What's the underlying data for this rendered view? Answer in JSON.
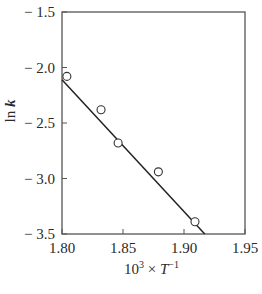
{
  "chart_data": {
    "type": "scatter",
    "title": "",
    "xlabel": "10^3 × T^-1",
    "xlabel_parts": {
      "base": "10",
      "exp": "3",
      "times": " × ",
      "var": "T",
      "var_exp": "−1"
    },
    "ylabel": "ln k",
    "xlim": [
      1.8,
      1.95
    ],
    "ylim": [
      -3.5,
      -1.5
    ],
    "xticks": [
      1.8,
      1.85,
      1.9,
      1.95
    ],
    "xtick_labels": [
      "1.80",
      "1.85",
      "1.90",
      "1.95"
    ],
    "yticks": [
      -1.5,
      -2.0,
      -2.5,
      -3.0,
      -3.5
    ],
    "ytick_labels": [
      "− 1.5",
      "− 2.0",
      "− 2.5",
      "− 3.0",
      "− 3.5"
    ],
    "grid": false,
    "legend": null,
    "series": [
      {
        "name": "measured",
        "marker": "open-circle",
        "x": [
          1.804,
          1.832,
          1.846,
          1.879,
          1.909
        ],
        "y": [
          -2.08,
          -2.38,
          -2.68,
          -2.94,
          -3.39
        ]
      },
      {
        "name": "linear fit",
        "style": "line",
        "x": [
          1.8,
          1.917
        ],
        "y": [
          -2.11,
          -3.5
        ]
      }
    ]
  }
}
